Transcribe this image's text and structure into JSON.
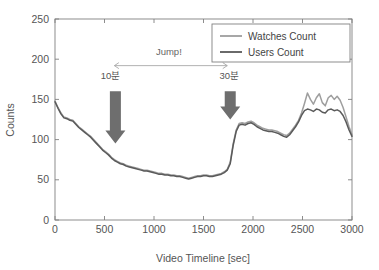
{
  "chart_data": {
    "type": "line",
    "title": "",
    "xlabel": "Video Timeline [sec]",
    "ylabel": "Counts",
    "xlim": [
      0,
      3000
    ],
    "ylim": [
      0,
      250
    ],
    "xticks": [
      0,
      500,
      1000,
      1500,
      2000,
      2500,
      3000
    ],
    "yticks": [
      0,
      50,
      100,
      150,
      200,
      250
    ],
    "grid": false,
    "legend_position": "top-right",
    "series": [
      {
        "name": "Watches Count",
        "color": "#9e9e9e",
        "x": [
          0,
          30,
          60,
          90,
          120,
          150,
          180,
          210,
          240,
          270,
          300,
          330,
          360,
          390,
          420,
          450,
          480,
          510,
          540,
          570,
          600,
          630,
          660,
          690,
          720,
          750,
          780,
          810,
          840,
          870,
          900,
          930,
          960,
          990,
          1020,
          1050,
          1080,
          1110,
          1140,
          1170,
          1200,
          1230,
          1260,
          1290,
          1320,
          1350,
          1380,
          1410,
          1440,
          1470,
          1500,
          1530,
          1560,
          1590,
          1620,
          1650,
          1680,
          1710,
          1740,
          1770,
          1800,
          1830,
          1860,
          1890,
          1920,
          1950,
          1980,
          2010,
          2040,
          2070,
          2100,
          2130,
          2160,
          2190,
          2220,
          2250,
          2280,
          2310,
          2340,
          2370,
          2400,
          2430,
          2460,
          2490,
          2520,
          2550,
          2580,
          2610,
          2640,
          2670,
          2700,
          2730,
          2760,
          2790,
          2820,
          2850,
          2880,
          2910,
          2940,
          2970,
          3000
        ],
        "values": [
          148,
          140,
          133,
          128,
          127,
          125,
          124,
          120,
          116,
          113,
          110,
          107,
          104,
          100,
          96,
          92,
          88,
          85,
          82,
          78,
          75,
          73,
          71,
          70,
          68,
          67,
          66,
          65,
          64,
          63,
          62,
          62,
          61,
          60,
          59,
          58,
          58,
          57,
          57,
          56,
          56,
          55,
          55,
          54,
          53,
          52,
          53,
          54,
          55,
          55,
          56,
          56,
          55,
          55,
          56,
          57,
          58,
          60,
          63,
          72,
          95,
          112,
          120,
          121,
          120,
          122,
          123,
          121,
          118,
          116,
          114,
          113,
          112,
          112,
          111,
          110,
          108,
          106,
          105,
          108,
          113,
          118,
          124,
          133,
          145,
          158,
          150,
          144,
          152,
          157,
          146,
          142,
          152,
          155,
          150,
          154,
          149,
          140,
          128,
          116,
          106
        ]
      },
      {
        "name": "Users Count",
        "color": "#5a5a5a",
        "x": [
          0,
          30,
          60,
          90,
          120,
          150,
          180,
          210,
          240,
          270,
          300,
          330,
          360,
          390,
          420,
          450,
          480,
          510,
          540,
          570,
          600,
          630,
          660,
          690,
          720,
          750,
          780,
          810,
          840,
          870,
          900,
          930,
          960,
          990,
          1020,
          1050,
          1080,
          1110,
          1140,
          1170,
          1200,
          1230,
          1260,
          1290,
          1320,
          1350,
          1380,
          1410,
          1440,
          1470,
          1500,
          1530,
          1560,
          1590,
          1620,
          1650,
          1680,
          1710,
          1740,
          1770,
          1800,
          1830,
          1860,
          1890,
          1920,
          1950,
          1980,
          2010,
          2040,
          2070,
          2100,
          2130,
          2160,
          2190,
          2220,
          2250,
          2280,
          2310,
          2340,
          2370,
          2400,
          2430,
          2460,
          2490,
          2520,
          2550,
          2580,
          2610,
          2640,
          2670,
          2700,
          2730,
          2760,
          2790,
          2820,
          2850,
          2880,
          2910,
          2940,
          2970,
          3000
        ],
        "values": [
          147,
          139,
          132,
          127,
          126,
          124,
          123,
          119,
          115,
          112,
          109,
          106,
          103,
          99,
          95,
          91,
          87,
          84,
          81,
          77,
          74,
          72,
          70,
          69,
          67,
          66,
          65,
          64,
          63,
          62,
          61,
          61,
          60,
          59,
          58,
          57,
          57,
          56,
          56,
          55,
          55,
          54,
          54,
          53,
          52,
          51,
          52,
          53,
          54,
          54,
          55,
          55,
          54,
          54,
          55,
          56,
          57,
          59,
          62,
          70,
          93,
          110,
          118,
          119,
          118,
          120,
          121,
          119,
          116,
          114,
          112,
          111,
          110,
          110,
          109,
          108,
          106,
          104,
          103,
          106,
          111,
          116,
          122,
          130,
          136,
          138,
          137,
          135,
          138,
          137,
          134,
          133,
          137,
          138,
          136,
          137,
          135,
          130,
          122,
          112,
          104
        ]
      }
    ],
    "annotations": [
      {
        "name": "jump-label",
        "text": "Jump!",
        "x": 1150,
        "y": 205
      },
      {
        "name": "arrow-label-start",
        "text": "10분",
        "x": 560,
        "y": 175
      },
      {
        "name": "arrow-label-end",
        "text": "30분",
        "x": 1760,
        "y": 175
      },
      {
        "name": "span-arrow",
        "text": "",
        "x_start": 600,
        "x_end": 1740,
        "y": 192
      },
      {
        "name": "down-arrow-start",
        "text": "",
        "x": 610,
        "y_top": 160,
        "y_bottom": 95
      },
      {
        "name": "down-arrow-end",
        "text": "",
        "x": 1770,
        "y_top": 160,
        "y_bottom": 125
      }
    ]
  },
  "legend": {
    "items": [
      {
        "label": "Watches Count",
        "color": "#9e9e9e"
      },
      {
        "label": "Users Count",
        "color": "#5a5a5a"
      }
    ]
  },
  "axes": {
    "x_title": "Video Timeline [sec]",
    "y_title": "Counts",
    "x_tick_labels": [
      "0",
      "500",
      "1000",
      "1500",
      "2000",
      "2500",
      "3000"
    ],
    "y_tick_labels": [
      "0",
      "50",
      "100",
      "150",
      "200",
      "250"
    ]
  },
  "colors": {
    "axis": "#808080",
    "text": "#555555",
    "arrow_fill": "#6e6e6e",
    "span_arrow": "#a8a8a8",
    "background": "#ffffff"
  }
}
